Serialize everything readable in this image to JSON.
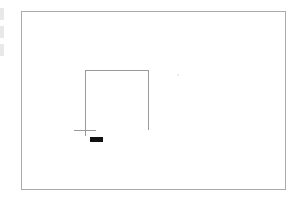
{
  "canvas": {
    "label": "drawing-canvas",
    "border_color": "#aaaaaa",
    "background": "#ffffff"
  },
  "shape": {
    "type": "open-rectangle",
    "stroke_color": "#9a9a9a"
  },
  "cursor": {
    "type": "crosshair",
    "label_color": "#111111"
  }
}
